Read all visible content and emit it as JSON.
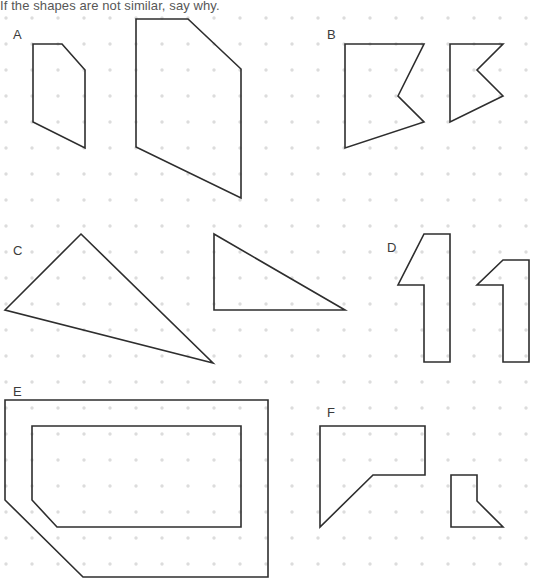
{
  "prompt": {
    "text": "If the shapes are not similar, say why."
  },
  "canvas": {
    "width": 538,
    "height": 581,
    "background_color": "#ffffff",
    "stroke_color": "#2e2e2e",
    "label_color": "#3b3b3b",
    "prompt_color": "#575757"
  },
  "grid": {
    "dot_color": "#dcdcdc",
    "dot_radius": 1.7,
    "spacing": 26,
    "origin_x": 6,
    "origin_y": 18,
    "cols": 21,
    "rows": 22
  },
  "labels": [
    {
      "name": "A",
      "text": "A",
      "x": 13,
      "y": 28
    },
    {
      "name": "B",
      "text": "B",
      "x": 327,
      "y": 28
    },
    {
      "name": "C",
      "text": "C",
      "x": 13,
      "y": 244
    },
    {
      "name": "D",
      "text": "D",
      "x": 387,
      "y": 241
    },
    {
      "name": "E",
      "text": "E",
      "x": 13,
      "y": 385
    },
    {
      "name": "F",
      "text": "F",
      "x": 327,
      "y": 406
    }
  ],
  "shape_groups": [
    {
      "id": "A",
      "label": "A",
      "figures": [
        {
          "name": "pentagon-small",
          "closed": true,
          "points": "33,44 62,44 85,70 85,148 33,122"
        },
        {
          "name": "pentagon-large",
          "closed": true,
          "points": "136,19 188,19 241,69 241,198 136,147"
        }
      ]
    },
    {
      "id": "B",
      "label": "B",
      "figures": [
        {
          "name": "arrow-notch-large",
          "closed": true,
          "points": "345,44 424,44 398,96 424,122 345,148"
        },
        {
          "name": "arrow-notch-small",
          "closed": true,
          "points": "450,44 503,44 477,70 503,96 450,122"
        }
      ]
    },
    {
      "id": "C",
      "label": "C",
      "figures": [
        {
          "name": "triangle-obtuse",
          "closed": true,
          "points": "81,234 213,363 5,310"
        },
        {
          "name": "triangle-right",
          "closed": true,
          "points": "214,234 345,310 214,310"
        }
      ]
    },
    {
      "id": "D",
      "label": "D",
      "figures": [
        {
          "name": "digit-one-large",
          "closed": true,
          "points": "424,234 450,234 450,362 424,362 424,285 398,285"
        },
        {
          "name": "digit-one-small",
          "closed": true,
          "points": "503,260 529,260 529,362 503,362 503,285 477,285"
        }
      ]
    },
    {
      "id": "E",
      "label": "E",
      "figures": [
        {
          "name": "pentagon-outer",
          "closed": true,
          "points": "5,400 268,400 268,577 83,577 5,500"
        },
        {
          "name": "pentagon-inner",
          "closed": true,
          "points": "32,426 241,426 241,527 57,527 32,500"
        }
      ]
    },
    {
      "id": "F",
      "label": "F",
      "figures": [
        {
          "name": "chevron-large",
          "closed": true,
          "points": "320,426 425,426 425,475 373,475 320,527"
        },
        {
          "name": "chevron-small",
          "closed": true,
          "points": "451,475 477,475 477,501 503,527 451,527"
        }
      ]
    }
  ]
}
